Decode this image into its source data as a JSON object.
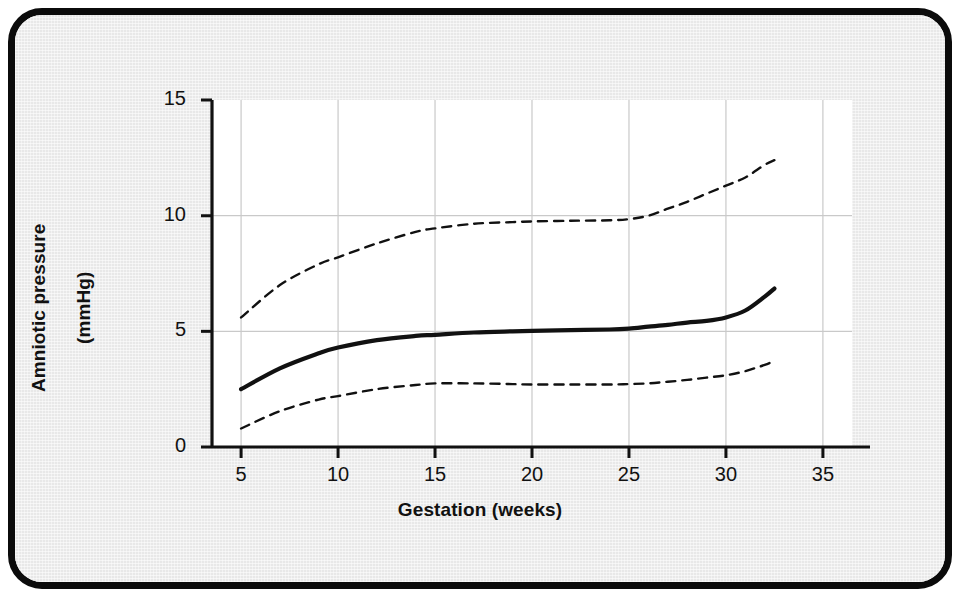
{
  "figure": {
    "background_color": "#e8e8e8",
    "plot_background_color": "#ffffff",
    "border_color": "#0b0b0b",
    "line_color": "#111111",
    "grid_color": "#c9c9c9"
  },
  "axes": {
    "x_title": "Gestation (weeks)",
    "y_title_line1": "Amniotic pressure",
    "y_title_line2": "(mmHg)",
    "y_title": "Amniotic pressure (mmHg)",
    "x_tick_labels": [
      "5",
      "10",
      "15",
      "20",
      "25",
      "30",
      "35"
    ],
    "y_tick_labels": [
      "0",
      "5",
      "10",
      "15"
    ]
  },
  "chart_data": {
    "type": "line",
    "title": "",
    "xlabel": "Gestation (weeks)",
    "ylabel": "Amniotic pressure (mmHg)",
    "xlim": [
      3.5,
      36.5
    ],
    "ylim": [
      0,
      15
    ],
    "xticks": [
      5,
      10,
      15,
      20,
      25,
      30,
      35
    ],
    "yticks": [
      0,
      5,
      10,
      15
    ],
    "grid": true,
    "legend": "none",
    "x": [
      5,
      7,
      9,
      10,
      12,
      14,
      15,
      17,
      19,
      20,
      22,
      24,
      25,
      26,
      27,
      28,
      29,
      30,
      31,
      32,
      32.5
    ],
    "series": [
      {
        "name": "Upper centile",
        "style": "dashed",
        "values": [
          5.6,
          7.0,
          7.9,
          8.2,
          8.8,
          9.3,
          9.45,
          9.65,
          9.72,
          9.75,
          9.78,
          9.8,
          9.85,
          10.0,
          10.3,
          10.6,
          10.95,
          11.3,
          11.65,
          12.2,
          12.4
        ]
      },
      {
        "name": "Median",
        "style": "solid",
        "values": [
          2.5,
          3.4,
          4.05,
          4.3,
          4.62,
          4.8,
          4.85,
          4.95,
          5.0,
          5.02,
          5.05,
          5.08,
          5.12,
          5.2,
          5.28,
          5.38,
          5.45,
          5.6,
          5.9,
          6.5,
          6.85
        ]
      },
      {
        "name": "Lower centile",
        "style": "dashed",
        "values": [
          0.8,
          1.55,
          2.05,
          2.2,
          2.5,
          2.68,
          2.75,
          2.75,
          2.72,
          2.7,
          2.7,
          2.7,
          2.72,
          2.75,
          2.82,
          2.9,
          3.0,
          3.1,
          3.28,
          3.55,
          3.72
        ]
      }
    ],
    "annotations": []
  }
}
